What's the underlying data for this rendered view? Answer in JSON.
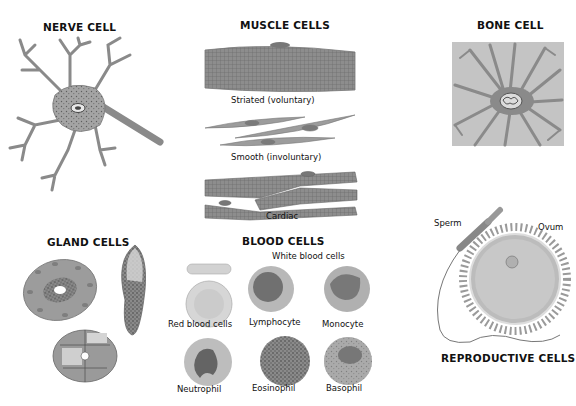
{
  "diagram": {
    "sections": {
      "nerve": {
        "title": "NERVE CELL"
      },
      "muscle": {
        "title": "MUSCLE CELLS",
        "types": [
          {
            "label": "Striated (voluntary)"
          },
          {
            "label": "Smooth (involuntary)"
          },
          {
            "label": "Cardiac"
          }
        ]
      },
      "bone": {
        "title": "BONE CELL"
      },
      "gland": {
        "title": "GLAND CELLS"
      },
      "blood": {
        "title": "BLOOD CELLS",
        "subtitle": "White blood cells",
        "cells": [
          {
            "label": "Red blood cells"
          },
          {
            "label": "Lymphocyte"
          },
          {
            "label": "Monocyte"
          },
          {
            "label": "Neutrophil"
          },
          {
            "label": "Eosinophil"
          },
          {
            "label": "Basophil"
          }
        ]
      },
      "reproductive": {
        "title": "REPRODUCTIVE CELLS",
        "parts": [
          {
            "label": "Sperm"
          },
          {
            "label": "Ovum"
          }
        ]
      }
    },
    "colors": {
      "cell_fill": "#9a9a9a",
      "cell_light": "#cfcfcf",
      "nucleus": "#6e6e6e",
      "outline": "#555555"
    }
  }
}
